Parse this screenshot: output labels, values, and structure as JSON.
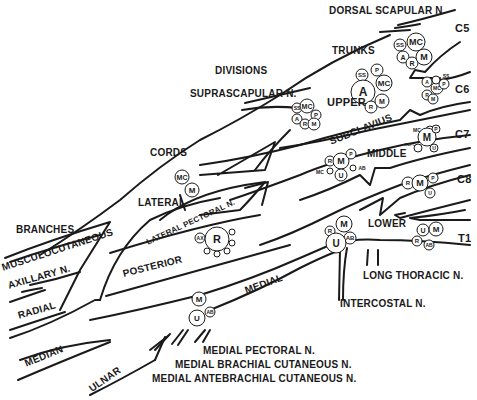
{
  "diagram": {
    "sections": {
      "roots": [
        "C5",
        "C6",
        "C7",
        "C8",
        "T1"
      ],
      "trunks_label": "TRUNKS",
      "divisions_label": "DIVISIONS",
      "cords_label": "CORDS",
      "branches_label": "BRANCHES"
    },
    "trunks": {
      "upper": "UPPER",
      "middle": "MIDDLE",
      "lower": "LOWER"
    },
    "cords": {
      "lateral": "LATERAL",
      "posterior": "POSTERIOR",
      "medial": "MEDIAL"
    },
    "nerves": {
      "dorsal_scapular": "DORSAL SCAPULAR N.",
      "suprascapular": "SUPRASCAPULAR N.",
      "subclavius": "SUBCLAVIUS",
      "long_thoracic": "LONG THORACIC N.",
      "intercostal": "INTERCOSTAL N.",
      "lateral_pectoral": "LATERAL PECTORAL N.",
      "medial_pectoral": "MEDIAL PECTORAL N.",
      "medial_brachial_cutaneous": "MEDIAL BRACHIAL CUTANEOUS N.",
      "medial_antebrachial_cutaneous": "MEDIAL ANTEBRACHIAL CUTANEOUS N."
    },
    "branches": {
      "musculocutaneous": "MUSCULOCUTANEOUS",
      "axillary": "AXILLARY N.",
      "radial": "RADIAL",
      "median": "MEDIAN",
      "ulnar": "ULNAR"
    },
    "fiber_circles": {
      "c5": [
        "SS",
        "MC",
        "A",
        "R",
        "M"
      ],
      "c6": [
        "A",
        "MC",
        "P",
        "R",
        "M",
        "SS"
      ],
      "c7": [
        "MC",
        "M",
        "P",
        "R+PC",
        "U"
      ],
      "c8": [
        "R",
        "M",
        "P",
        "U"
      ],
      "t1": [
        "U",
        "M",
        "R",
        "AB"
      ],
      "upper_trunk": [
        "SS",
        "P",
        "A",
        "MC",
        "R",
        "M"
      ],
      "upper_trunk_anterior": [
        "SS",
        "MC",
        "P",
        "A",
        "R",
        "M"
      ],
      "middle_trunk": [
        "R",
        "M",
        "P",
        "MC",
        "U",
        "AB"
      ],
      "lower_trunk": [
        "M",
        "R",
        "AB",
        "U"
      ],
      "lateral_cord": [
        "MC",
        "M"
      ],
      "posterior_cord": [
        "AX",
        "R"
      ],
      "medial_cord": [
        "M",
        "U",
        "AB"
      ]
    },
    "colors": {
      "ink": "#1a1a1a",
      "background": "#ffffff"
    }
  }
}
